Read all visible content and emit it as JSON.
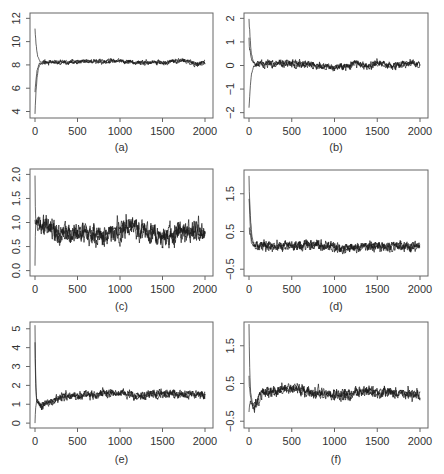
{
  "figure": {
    "panels_order": [
      "a",
      "b",
      "c",
      "d",
      "e",
      "f"
    ]
  },
  "chart_data": [
    {
      "id": "a",
      "caption": "(a)",
      "type": "line",
      "title": "",
      "xlabel": "",
      "ylabel": "",
      "xlim": [
        0,
        2000
      ],
      "ylim": [
        3.7,
        12.2
      ],
      "xticks": [
        0,
        500,
        1000,
        1500,
        2000
      ],
      "xtick_labels": [
        "0",
        "500",
        "1000",
        "1500",
        "2000"
      ],
      "yticks": [
        4,
        6,
        8,
        10,
        12
      ],
      "ytick_labels": [
        "4",
        "6",
        "8",
        "10",
        "12"
      ],
      "grid": false,
      "series": [
        {
          "name": "chains",
          "n_chains": 3,
          "start_values": [
            11.0,
            5.8,
            3.9
          ],
          "burn_in": 80,
          "stationary_mean": 8.25,
          "noise_amplitude": 0.15,
          "wander": [
            [
              0,
              8.2
            ],
            [
              500,
              8.25
            ],
            [
              1000,
              8.35
            ],
            [
              1200,
              8.2
            ],
            [
              1500,
              8.2
            ],
            [
              1750,
              8.4
            ],
            [
              1900,
              8.05
            ],
            [
              2000,
              8.25
            ]
          ]
        }
      ]
    },
    {
      "id": "b",
      "caption": "(b)",
      "type": "line",
      "title": "",
      "xlabel": "",
      "ylabel": "",
      "xlim": [
        0,
        2000
      ],
      "ylim": [
        -2.1,
        2.1
      ],
      "xticks": [
        0,
        500,
        1000,
        1500,
        2000
      ],
      "xtick_labels": [
        "0",
        "500",
        "1000",
        "1500",
        "2000"
      ],
      "yticks": [
        -2,
        -1,
        0,
        1,
        2
      ],
      "ytick_labels": [
        "−2",
        "−1",
        "0",
        "1",
        "2"
      ],
      "grid": false,
      "series": [
        {
          "name": "chains",
          "n_chains": 3,
          "start_values": [
            2.0,
            -2.0,
            1.2
          ],
          "burn_in": 80,
          "stationary_mean": 0.02,
          "noise_amplitude": 0.12,
          "wander": [
            [
              0,
              0.05
            ],
            [
              600,
              0.1
            ],
            [
              1000,
              -0.1
            ],
            [
              1250,
              0.1
            ],
            [
              1400,
              -0.05
            ],
            [
              1500,
              0.1
            ],
            [
              1700,
              -0.05
            ],
            [
              1900,
              0.15
            ],
            [
              2000,
              0.0
            ]
          ]
        }
      ]
    },
    {
      "id": "c",
      "caption": "(c)",
      "type": "line",
      "title": "",
      "xlabel": "",
      "ylabel": "",
      "xlim": [
        0,
        2000
      ],
      "ylim": [
        -0.05,
        2.05
      ],
      "xticks": [
        0,
        500,
        1000,
        1500,
        2000
      ],
      "xtick_labels": [
        "0",
        "500",
        "1000",
        "1500",
        "2000"
      ],
      "yticks": [
        0.0,
        0.5,
        1.0,
        1.5,
        2.0
      ],
      "ytick_labels": [
        "0.0",
        "0.5",
        "1.0",
        "1.5",
        "2.0"
      ],
      "grid": false,
      "series": [
        {
          "name": "chains",
          "n_chains": 3,
          "start_values": [
            2.0,
            0.0,
            1.0
          ],
          "burn_in": 15,
          "stationary_mean": 0.8,
          "noise_amplitude": 0.16,
          "wander": [
            [
              0,
              1.0
            ],
            [
              100,
              1.0
            ],
            [
              300,
              0.75
            ],
            [
              500,
              0.8
            ],
            [
              800,
              0.7
            ],
            [
              1100,
              0.95
            ],
            [
              1300,
              0.85
            ],
            [
              1500,
              0.65
            ],
            [
              1700,
              0.85
            ],
            [
              2000,
              0.75
            ]
          ]
        }
      ]
    },
    {
      "id": "d",
      "caption": "(d)",
      "type": "line",
      "title": "",
      "xlabel": "",
      "ylabel": "",
      "xlim": [
        0,
        2000
      ],
      "ylim": [
        -0.6,
        2.05
      ],
      "xticks": [
        0,
        500,
        1000,
        1500,
        2000
      ],
      "xtick_labels": [
        "0",
        "500",
        "1000",
        "1500",
        "2000"
      ],
      "yticks": [
        -0.5,
        0.5,
        1.5
      ],
      "ytick_labels": [
        "−0.5",
        "0.5",
        "1.5"
      ],
      "grid": false,
      "series": [
        {
          "name": "chains",
          "n_chains": 3,
          "start_values": [
            2.0,
            1.5,
            0.6
          ],
          "burn_in": 70,
          "stationary_mean": 0.1,
          "noise_amplitude": 0.1,
          "wander": [
            [
              0,
              0.1
            ],
            [
              800,
              0.15
            ],
            [
              1100,
              0.05
            ],
            [
              1500,
              0.12
            ],
            [
              2000,
              0.1
            ]
          ]
        }
      ]
    },
    {
      "id": "e",
      "caption": "(e)",
      "type": "line",
      "title": "",
      "xlabel": "",
      "ylabel": "",
      "xlim": [
        0,
        2000
      ],
      "ylim": [
        -0.1,
        5.2
      ],
      "xticks": [
        0,
        500,
        1000,
        1500,
        2000
      ],
      "xtick_labels": [
        "0",
        "500",
        "1000",
        "1500",
        "2000"
      ],
      "yticks": [
        0,
        1,
        2,
        3,
        4,
        5
      ],
      "ytick_labels": [
        "0",
        "1",
        "2",
        "3",
        "4",
        "5"
      ],
      "grid": false,
      "series": [
        {
          "name": "chains",
          "n_chains": 3,
          "start_values": [
            5.2,
            0.1,
            4.3
          ],
          "burn_in": 30,
          "stationary_mean": 1.5,
          "noise_amplitude": 0.17,
          "wander": [
            [
              0,
              1.1
            ],
            [
              100,
              1.0
            ],
            [
              300,
              1.35
            ],
            [
              700,
              1.55
            ],
            [
              1000,
              1.6
            ],
            [
              1250,
              1.4
            ],
            [
              1400,
              1.6
            ],
            [
              2000,
              1.5
            ]
          ]
        }
      ]
    },
    {
      "id": "f",
      "caption": "(f)",
      "type": "line",
      "title": "",
      "xlabel": "",
      "ylabel": "",
      "xlim": [
        0,
        2000
      ],
      "ylim": [
        -0.6,
        2.05
      ],
      "xticks": [
        0,
        500,
        1000,
        1500,
        2000
      ],
      "xtick_labels": [
        "0",
        "500",
        "1000",
        "1500",
        "2000"
      ],
      "yticks": [
        -0.5,
        0.5,
        1.5
      ],
      "ytick_labels": [
        "−0.5",
        "0.5",
        "1.5"
      ],
      "grid": false,
      "series": [
        {
          "name": "chains",
          "n_chains": 3,
          "start_values": [
            2.05,
            0.6,
            -0.2
          ],
          "burn_in": 40,
          "stationary_mean": 0.25,
          "noise_amplitude": 0.11,
          "wander": [
            [
              0,
              0.1
            ],
            [
              60,
              -0.1
            ],
            [
              150,
              0.25
            ],
            [
              300,
              0.3
            ],
            [
              550,
              0.4
            ],
            [
              700,
              0.25
            ],
            [
              1200,
              0.2
            ],
            [
              1300,
              0.3
            ],
            [
              1700,
              0.25
            ],
            [
              2000,
              0.2
            ]
          ]
        }
      ]
    }
  ],
  "layout": {
    "panels": {
      "a": {
        "left": 30,
        "top": 13,
        "right": 213,
        "bottom": 118,
        "caption_y": 147,
        "ticklabel_y": 131
      },
      "b": {
        "left": 244,
        "top": 13,
        "right": 428,
        "bottom": 118,
        "caption_y": 147,
        "ticklabel_y": 131
      },
      "c": {
        "left": 30,
        "top": 169,
        "right": 213,
        "bottom": 276,
        "caption_y": 306,
        "ticklabel_y": 289
      },
      "d": {
        "left": 244,
        "top": 170,
        "right": 428,
        "bottom": 276,
        "caption_y": 306,
        "ticklabel_y": 289
      },
      "e": {
        "left": 30,
        "top": 322,
        "right": 213,
        "bottom": 428,
        "caption_y": 459,
        "ticklabel_y": 441
      },
      "f": {
        "left": 244,
        "top": 322,
        "right": 428,
        "bottom": 428,
        "caption_y": 459,
        "ticklabel_y": 441
      }
    },
    "colors": {
      "trace": "#1a1a1a",
      "axes": "#666666",
      "text": "#333333",
      "background": "#ffffff"
    }
  }
}
